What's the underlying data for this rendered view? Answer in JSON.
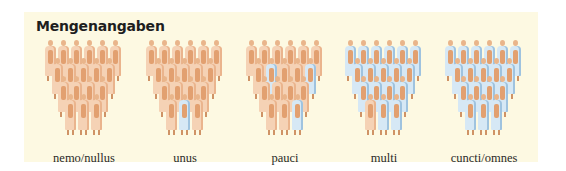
{
  "title": "Mengenangaben",
  "colors": {
    "panel_background": "#fdf9e2",
    "figure_default": "#f5d2b5",
    "figure_highlight": "#d6e8f5",
    "text": "#1e1e1e"
  },
  "layout": {
    "rows": [
      6,
      5,
      4,
      3
    ],
    "figure_count_per_group": 18
  },
  "groups": [
    {
      "label": "nemo/nullus",
      "highlighted": []
    },
    {
      "label": "unus",
      "highlighted": [
        16
      ]
    },
    {
      "label": "pauci",
      "highlighted": [
        7,
        10,
        17
      ]
    },
    {
      "label": "multi",
      "highlighted": [
        0,
        1,
        2,
        3,
        4,
        5,
        6,
        7,
        8,
        9,
        10,
        11,
        12,
        13,
        14,
        16,
        17
      ]
    },
    {
      "label": "cuncti/omnes",
      "highlighted": [
        0,
        1,
        2,
        3,
        4,
        5,
        6,
        7,
        8,
        9,
        10,
        11,
        12,
        13,
        14,
        15,
        16,
        17
      ]
    }
  ]
}
